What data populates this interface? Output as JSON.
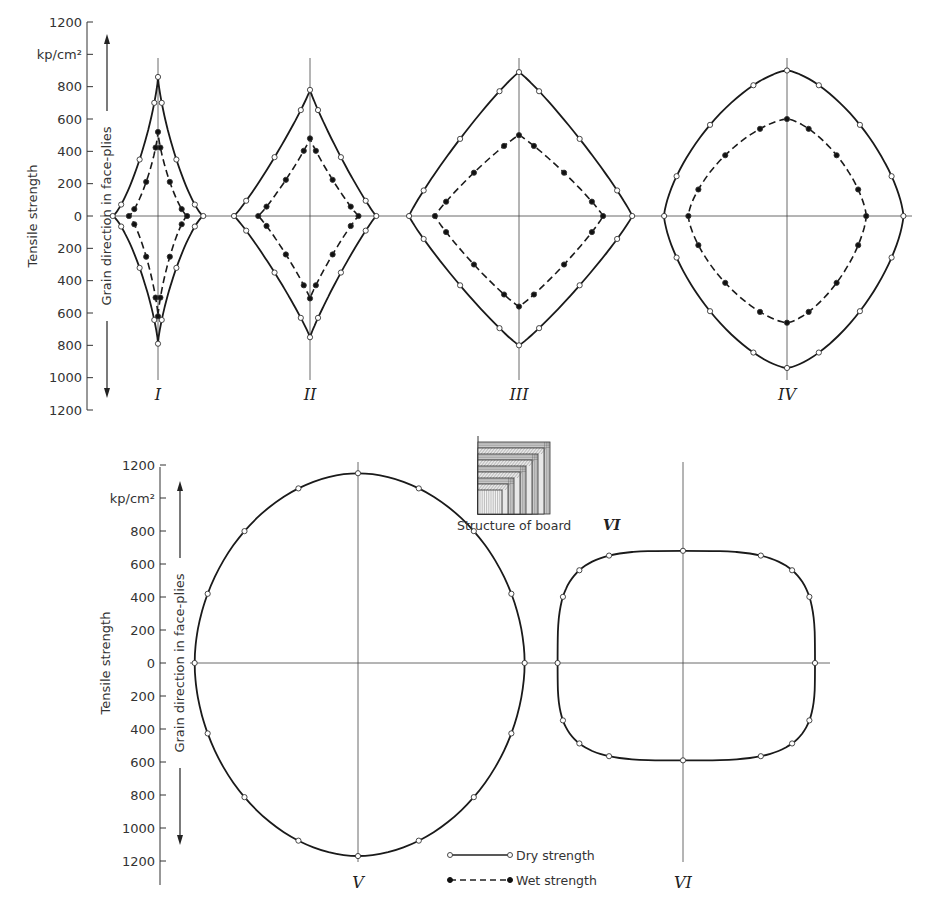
{
  "figure": {
    "unit_label": "kp/cm²",
    "axis_title": "Tensile strength",
    "direction_label": "Grain direction in face-plies",
    "inset_caption": "Structure of board",
    "inset_board": "VI",
    "legend": [
      {
        "label": "Dry strength",
        "style": "solid, open circles"
      },
      {
        "label": "Wet strength",
        "style": "dashed, filled circles"
      }
    ]
  },
  "chart_data": [
    {
      "type": "polar-profile",
      "panel": "top",
      "title": "Tensile strength of boards I–IV by direction (dry vs wet)",
      "ylabel": "Tensile strength (kp/cm²)",
      "yticks": [
        1200,
        "kp/cm²",
        800,
        600,
        400,
        200,
        0,
        200,
        400,
        600,
        800,
        1000,
        1200
      ],
      "ylim": [
        -1200,
        1200
      ],
      "boards": [
        {
          "name": "I",
          "dry": {
            "up": 860,
            "down": 790,
            "left": 280,
            "right": 280
          },
          "wet": {
            "up": 520,
            "down": 620,
            "left": 180,
            "right": 180
          }
        },
        {
          "name": "II",
          "dry": {
            "up": 780,
            "down": 750,
            "left": 470,
            "right": 410
          },
          "wet": {
            "up": 480,
            "down": 510,
            "left": 320,
            "right": 300
          }
        },
        {
          "name": "III",
          "dry": {
            "up": 890,
            "down": 800,
            "left": 680,
            "right": 700
          },
          "wet": {
            "up": 500,
            "down": 560,
            "left": 520,
            "right": 520
          }
        },
        {
          "name": "IV",
          "dry": {
            "up": 900,
            "down": 940,
            "left": 760,
            "right": 720
          },
          "wet": {
            "up": 600,
            "down": 660,
            "left": 610,
            "right": 490
          }
        }
      ]
    },
    {
      "type": "polar-profile",
      "panel": "bottom",
      "title": "Tensile strength of boards V and VI by direction (dry)",
      "ylabel": "Tensile strength (kp/cm²)",
      "yticks": [
        1200,
        "kp/cm²",
        800,
        600,
        400,
        200,
        0,
        200,
        400,
        600,
        800,
        1000,
        1200
      ],
      "ylim": [
        -1200,
        1200
      ],
      "boards": [
        {
          "name": "V",
          "dry": {
            "up": 1150,
            "down": 1170,
            "left": 990,
            "right": 1010
          }
        },
        {
          "name": "VI",
          "dry": {
            "up": 680,
            "down": 590,
            "left": 760,
            "right": 800
          }
        }
      ]
    }
  ]
}
